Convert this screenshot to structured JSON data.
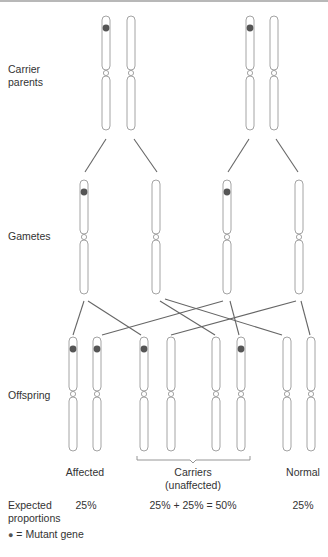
{
  "diagram": {
    "type": "autosomal-recessive-inheritance",
    "row_labels": {
      "parents_line1": "Carrier",
      "parents_line2": "parents",
      "gametes": "Gametes",
      "offspring": "Offspring"
    },
    "parents": [
      {
        "x": 106,
        "mutant": true
      },
      {
        "x": 131,
        "mutant": false
      },
      {
        "x": 250,
        "mutant": true
      },
      {
        "x": 274,
        "mutant": false
      }
    ],
    "gametes": [
      {
        "x": 84,
        "mutant": true
      },
      {
        "x": 156,
        "mutant": false
      },
      {
        "x": 227,
        "mutant": true
      },
      {
        "x": 299,
        "mutant": false
      }
    ],
    "offspring": [
      {
        "x": 73,
        "mutant": true
      },
      {
        "x": 97,
        "mutant": true
      },
      {
        "x": 144,
        "mutant": true
      },
      {
        "x": 171,
        "mutant": false
      },
      {
        "x": 216,
        "mutant": false
      },
      {
        "x": 241,
        "mutant": true
      },
      {
        "x": 287,
        "mutant": false
      },
      {
        "x": 311,
        "mutant": false
      }
    ],
    "outcomes": {
      "affected": "Affected",
      "carriers_line1": "Carriers",
      "carriers_line2": "(unaffected)",
      "normal": "Normal"
    },
    "proportions": {
      "label_line1": "Expected",
      "label_line2": "proportions",
      "affected": "25%",
      "carriers": "25% + 25% = 50%",
      "normal": "25%"
    },
    "legend": {
      "symbol": "●",
      "text": "= Mutant gene"
    },
    "colors": {
      "chromosome_stroke": "#9a9a9a",
      "line": "#666666",
      "mutant_dot": "#555555",
      "text": "#333333"
    }
  }
}
